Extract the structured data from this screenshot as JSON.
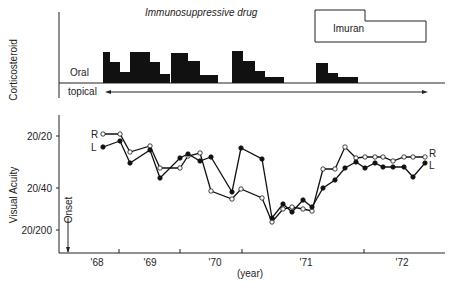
{
  "chart_data": [
    {
      "type": "bar",
      "title": "Corticosteroid",
      "ylabel": "Corticosteroid",
      "labels": {
        "oral": "Oral",
        "topical": "topical",
        "immuno": "Immunosuppressive drug",
        "imuran": "Imuran"
      },
      "oral_blocks": [
        {
          "x": [
            103,
            110,
            120,
            130,
            150,
            160
          ],
          "h": [
            31,
            21,
            11,
            31,
            21,
            9
          ]
        },
        {
          "x": [
            171,
            188,
            200,
            218
          ],
          "h": [
            30,
            22,
            8,
            0
          ]
        },
        {
          "x": [
            232,
            243,
            255,
            265,
            284
          ],
          "h": [
            32,
            22,
            12,
            6,
            0
          ]
        },
        {
          "x": [
            316,
            328,
            338,
            358
          ],
          "h": [
            20,
            10,
            6,
            0
          ]
        }
      ]
    },
    {
      "type": "line",
      "ylabel": "Visual Acuity",
      "xlabel": "(year)",
      "x_ticks": [
        "'68",
        "'69",
        "'70",
        "'71",
        "'72"
      ],
      "y_ticks": [
        "20/20",
        "20/40",
        "20/200"
      ],
      "onset_label": "Onset",
      "series": [
        {
          "name": "R",
          "points": [
            [
              103,
              134
            ],
            [
              120,
              134
            ],
            [
              130,
              152
            ],
            [
              150,
              146
            ],
            [
              160,
              168
            ],
            [
              180,
              168
            ],
            [
              188,
              156
            ],
            [
              200,
              153
            ],
            [
              211,
              191
            ],
            [
              232,
              199
            ],
            [
              241,
              189
            ],
            [
              262,
              198
            ],
            [
              272,
              222
            ],
            [
              283,
              209
            ],
            [
              292,
              207
            ],
            [
              303,
              209
            ],
            [
              312,
              211
            ],
            [
              323,
              169
            ],
            [
              335,
              169
            ],
            [
              345,
              147
            ],
            [
              356,
              158
            ],
            [
              365,
              157
            ],
            [
              375,
              157
            ],
            [
              383,
              157
            ],
            [
              393,
              161
            ],
            [
              404,
              157
            ],
            [
              413,
              157
            ],
            [
              425,
              157
            ]
          ]
        },
        {
          "name": "L",
          "points": [
            [
              103,
              147
            ],
            [
              120,
              141
            ],
            [
              130,
              163
            ],
            [
              150,
              150
            ],
            [
              160,
              178
            ],
            [
              180,
              158
            ],
            [
              188,
              154
            ],
            [
              200,
              161
            ],
            [
              211,
              157
            ],
            [
              232,
              192
            ],
            [
              241,
              148
            ],
            [
              262,
              159
            ],
            [
              272,
              218
            ],
            [
              283,
              204
            ],
            [
              292,
              212
            ],
            [
              303,
              200
            ],
            [
              312,
              207
            ],
            [
              323,
              188
            ],
            [
              335,
              180
            ],
            [
              345,
              168
            ],
            [
              356,
              162
            ],
            [
              365,
              168
            ],
            [
              375,
              163
            ],
            [
              383,
              167
            ],
            [
              393,
              167
            ],
            [
              404,
              167
            ],
            [
              413,
              177
            ],
            [
              425,
              163
            ]
          ]
        }
      ]
    }
  ]
}
